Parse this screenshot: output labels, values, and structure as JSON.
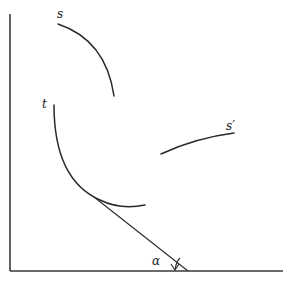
{
  "diagram": {
    "labels": {
      "s": "s",
      "t": "t",
      "s_prime": "s′",
      "alpha": "α"
    },
    "colors": {
      "stroke": "#2a2a2a",
      "background": "#ffffff"
    },
    "elements": [
      {
        "name": "vertical-axis",
        "from": [
          10,
          14
        ],
        "to": [
          10,
          271
        ]
      },
      {
        "name": "horizontal-axis",
        "from": [
          10,
          271
        ],
        "to": [
          283,
          271
        ]
      },
      {
        "name": "curve-s",
        "from": [
          58,
          24
        ],
        "to": [
          114,
          96
        ],
        "label": "s"
      },
      {
        "name": "curve-t",
        "from": [
          54,
          105
        ],
        "to": [
          145,
          205
        ],
        "label": "t"
      },
      {
        "name": "curve-s-prime",
        "from": [
          161,
          154
        ],
        "to": [
          234,
          133
        ],
        "label": "s′"
      },
      {
        "name": "tangent-line",
        "from": [
          96,
          198
        ],
        "to": [
          188,
          271
        ]
      },
      {
        "name": "angle-alpha",
        "at": [
          175,
          264
        ],
        "label": "α"
      }
    ]
  }
}
